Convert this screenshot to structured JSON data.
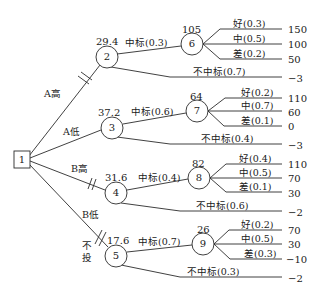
{
  "diagram": {
    "type": "decision-tree",
    "root": {
      "id": "1",
      "shape": "square"
    },
    "decisions": [
      {
        "label": "A高",
        "to": "2",
        "pruned": true
      },
      {
        "label": "A低",
        "to": "3",
        "pruned": false
      },
      {
        "label": "B高",
        "to": "4",
        "pruned": true
      },
      {
        "label": "B低",
        "to": "5",
        "pruned": false
      },
      {
        "label": "不投",
        "to": "5_none",
        "pruned": true
      }
    ],
    "nodes": {
      "n2": {
        "id": "2",
        "ev": "29.4"
      },
      "n3": {
        "id": "3",
        "ev": "37.2"
      },
      "n4": {
        "id": "4",
        "ev": "31.6"
      },
      "n5": {
        "id": "5",
        "ev": "17.6"
      },
      "n6": {
        "id": "6",
        "ev": "105"
      },
      "n7": {
        "id": "7",
        "ev": "64"
      },
      "n8": {
        "id": "8",
        "ev": "82"
      },
      "n9": {
        "id": "9",
        "ev": "26"
      }
    },
    "bid_branches": {
      "n2_win": "中标(0.3)",
      "n2_lose": "不中标(0.7)",
      "n2_lose_payoff": "−3",
      "n3_win": "中标(0.6)",
      "n3_lose": "不中标(0.4)",
      "n3_lose_payoff": "−3",
      "n4_win": "中标(0.4)",
      "n4_lose": "不中标(0.6)",
      "n4_lose_payoff": "−2",
      "n5_win": "中标(0.7)",
      "n5_lose": "不中标(0.3)",
      "n5_lose_payoff": "−2"
    },
    "outcomes": {
      "n6": [
        {
          "label": "好(0.3)",
          "payoff": "150"
        },
        {
          "label": "中(0.5)",
          "payoff": "100"
        },
        {
          "label": "差(0.2)",
          "payoff": "50"
        }
      ],
      "n7": [
        {
          "label": "好(0.2)",
          "payoff": "110"
        },
        {
          "label": "中(0.7)",
          "payoff": "60"
        },
        {
          "label": "差(0.1)",
          "payoff": "0"
        }
      ],
      "n8": [
        {
          "label": "好(0.4)",
          "payoff": "110"
        },
        {
          "label": "中(0.5)",
          "payoff": "70"
        },
        {
          "label": "差(0.1)",
          "payoff": "30"
        }
      ],
      "n9": [
        {
          "label": "好(0.2)",
          "payoff": "70"
        },
        {
          "label": "中(0.5)",
          "payoff": "30"
        },
        {
          "label": "差(0.3)",
          "payoff": "−10"
        }
      ]
    },
    "labels": {
      "a_high": "A高",
      "a_low": "A低",
      "b_high": "B高",
      "b_low": "B低",
      "no_invest": "不投"
    },
    "colors": {
      "line": "#2b2b2b",
      "text": "#1a1a1a",
      "background": "#ffffff"
    }
  }
}
